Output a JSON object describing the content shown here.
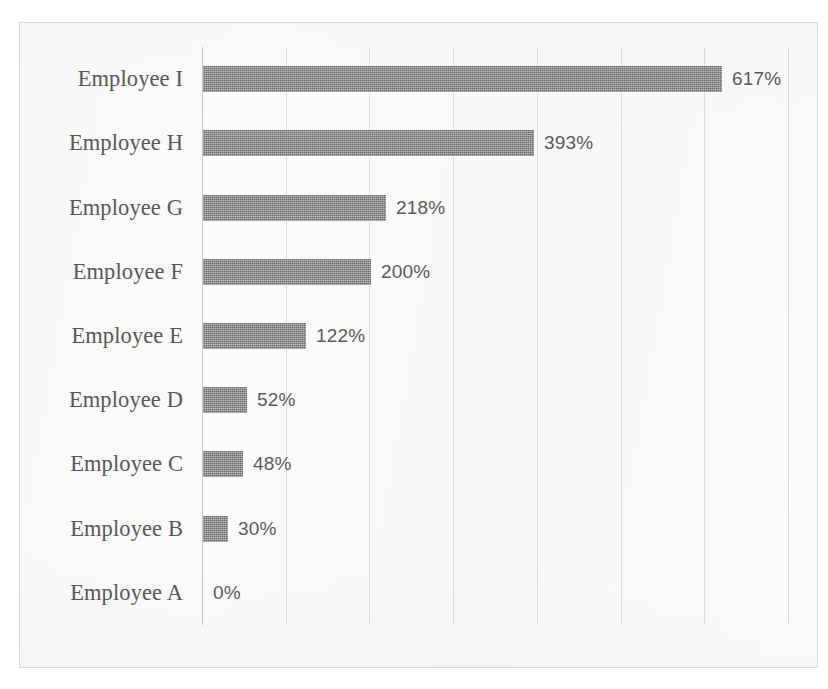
{
  "chart_data": {
    "type": "bar",
    "orientation": "horizontal",
    "title": "",
    "subtitle": "",
    "xlabel": "",
    "ylabel": "",
    "categories": [
      "Employee I",
      "Employee H",
      "Employee G",
      "Employee F",
      "Employee E",
      "Employee D",
      "Employee C",
      "Employee B",
      "Employee A"
    ],
    "values": [
      617,
      393,
      218,
      200,
      122,
      52,
      48,
      30,
      0
    ],
    "value_labels": [
      "617%",
      "393%",
      "218%",
      "200%",
      "122%",
      "52%",
      "48%",
      "30%",
      "0%"
    ],
    "unit": "%",
    "xlim": [
      0,
      700
    ],
    "ylim": null,
    "grid": true,
    "grid_axis": "x",
    "gridline_count": 7,
    "gridline_step_percent": 83,
    "legend": false,
    "legend_position": "none",
    "tick_labels_x": [],
    "tick_labels_y": [
      "Employee I",
      "Employee H",
      "Employee G",
      "Employee F",
      "Employee E",
      "Employee D",
      "Employee C",
      "Employee B",
      "Employee A"
    ],
    "data_labels_shown": true,
    "annotations": []
  },
  "style": {
    "bar_color": "#7c7c7c",
    "gridline_color": "#dedede",
    "axis_color": "#c9c9c9",
    "frame_color": "#d8d8d6",
    "plot_background": "#fbfbfa",
    "page_background": "#ffffff",
    "category_label_color": "#58585a",
    "value_label_color": "#5c5c5e"
  }
}
